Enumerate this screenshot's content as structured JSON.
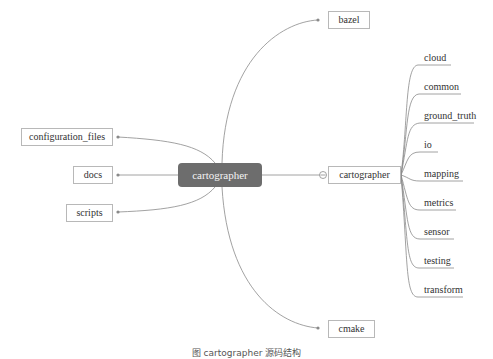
{
  "root": {
    "label": "cartographer"
  },
  "left_children": [
    {
      "label": "configuration_files"
    },
    {
      "label": "docs"
    },
    {
      "label": "scripts"
    }
  ],
  "right_children": [
    {
      "label": "bazel"
    },
    {
      "label": "cartographer"
    },
    {
      "label": "cmake"
    }
  ],
  "sub_children": [
    {
      "label": "cloud"
    },
    {
      "label": "common"
    },
    {
      "label": "ground_truth"
    },
    {
      "label": "io"
    },
    {
      "label": "mapping"
    },
    {
      "label": "metrics"
    },
    {
      "label": "sensor"
    },
    {
      "label": "testing"
    },
    {
      "label": "transform"
    }
  ],
  "caption": "图 cartographer 源码结构",
  "colors": {
    "root_fill": "#6d6d6d",
    "line": "#8a8a8a",
    "border": "#b8b8b8"
  }
}
